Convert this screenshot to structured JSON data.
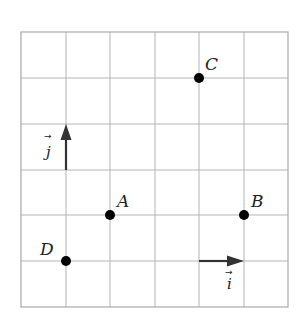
{
  "grid": {
    "cols": 6,
    "rows": 6,
    "x0": 21,
    "y0": 32,
    "x1": 288,
    "y1": 307,
    "line_color": "#b4b4b4"
  },
  "points": [
    {
      "label": "A",
      "gx": 2,
      "gy": 2
    },
    {
      "label": "B",
      "gx": 5,
      "gy": 2
    },
    {
      "label": "C",
      "gx": 4,
      "gy": 5
    },
    {
      "label": "D",
      "gx": 1,
      "gy": 1
    }
  ],
  "vectors": [
    {
      "name": "j",
      "label": "j",
      "arrow": "→",
      "from": [
        1,
        2
      ],
      "to": [
        1,
        3
      ]
    },
    {
      "name": "i",
      "label": "i",
      "arrow": "→",
      "from": [
        4,
        1
      ],
      "to": [
        5,
        1
      ]
    }
  ],
  "labels": {
    "A": "A",
    "B": "B",
    "C": "C",
    "D": "D",
    "vec_i": "i",
    "vec_j": "j",
    "vec_arrow": "→"
  }
}
